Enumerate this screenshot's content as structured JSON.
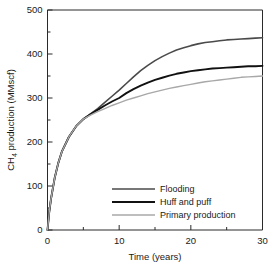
{
  "chart_data": {
    "type": "line",
    "title": "",
    "xlabel": "Time (years)",
    "ylabel": "CH4 production (MMscf)",
    "ylabel_prefix": "CH",
    "ylabel_sub": "4",
    "ylabel_suffix": " production (MMscf)",
    "xlim": [
      0,
      30
    ],
    "ylim": [
      0,
      500
    ],
    "xticks": [
      0,
      10,
      20,
      30
    ],
    "xticklabels": [
      "0",
      "10",
      "20",
      "30"
    ],
    "xminorticks": [
      5,
      15,
      25
    ],
    "yticks": [
      0,
      100,
      200,
      300,
      400,
      500
    ],
    "yticklabels": [
      "0",
      "100",
      "200",
      "300",
      "400",
      "500"
    ],
    "yminorticks": [
      50,
      150,
      250,
      350,
      450
    ],
    "grid": false,
    "legend_position": "lower right",
    "x": [
      0,
      0.25,
      0.5,
      1,
      1.5,
      2,
      3,
      4,
      5,
      6,
      7,
      8,
      9,
      10,
      11,
      12,
      13,
      14,
      15,
      16,
      17,
      18,
      19,
      20,
      21,
      22,
      23,
      24,
      25,
      26,
      27,
      28,
      29,
      30
    ],
    "series": [
      {
        "name": "Flooding",
        "color": "#4a4a4a",
        "width": 1.6,
        "values": [
          0,
          42,
          72,
          118,
          152,
          178,
          212,
          236,
          252,
          264,
          276,
          290,
          304,
          318,
          333,
          348,
          362,
          374,
          385,
          394,
          402,
          409,
          414,
          419,
          423,
          426,
          428,
          430,
          432,
          433,
          434,
          435,
          436,
          437
        ]
      },
      {
        "name": "Huff and puff",
        "color": "#111111",
        "width": 1.9,
        "values": [
          0,
          42,
          72,
          118,
          152,
          178,
          212,
          236,
          252,
          263,
          273,
          283,
          292,
          300,
          311,
          320,
          328,
          335,
          341,
          346,
          351,
          355,
          358,
          361,
          363,
          365,
          367,
          368,
          369,
          370,
          371,
          372,
          372,
          373
        ]
      },
      {
        "name": "Primary production",
        "color": "#a8a8a8",
        "width": 1.4,
        "values": [
          0,
          42,
          72,
          118,
          152,
          178,
          212,
          236,
          252,
          261,
          269,
          276,
          283,
          289,
          295,
          300,
          305,
          310,
          314,
          318,
          322,
          325,
          328,
          331,
          334,
          337,
          339,
          341,
          343,
          345,
          347,
          348,
          349,
          350
        ]
      }
    ],
    "legend": [
      {
        "label": "Flooding",
        "color": "#4a4a4a",
        "width": 1.6
      },
      {
        "label": "Huff and puff",
        "color": "#111111",
        "width": 1.9
      },
      {
        "label": "Primary production",
        "color": "#a8a8a8",
        "width": 1.4
      }
    ]
  }
}
